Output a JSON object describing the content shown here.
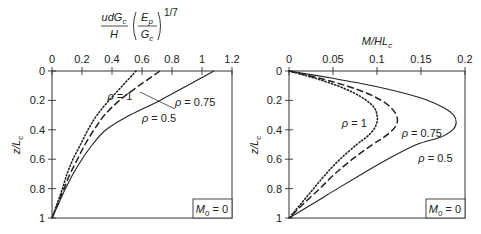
{
  "chart_data": [
    {
      "type": "line",
      "title": "",
      "xlabel": "udG_c/H (E_p/G_c)^(1/7)",
      "xlabel_parts": {
        "numerator": "udG",
        "numerator_sub": "c",
        "denominator": "H",
        "paren_num": "E",
        "paren_num_sub": "p",
        "paren_den": "G",
        "paren_den_sub": "c",
        "exponent": "1/7"
      },
      "ylabel": "z/L_c",
      "ylabel_parts": {
        "main": "z/L",
        "sub": "c"
      },
      "xlim": [
        0,
        1.2
      ],
      "ylim": [
        0,
        1
      ],
      "y_inverted": true,
      "x_axis_position": "top",
      "xticks": [
        "0",
        "0.2",
        "0.4",
        "0.6",
        "0.8",
        "1",
        "1.2"
      ],
      "yticks": [
        "0",
        "0.2",
        "0.4",
        "0.6",
        "0.8",
        "1"
      ],
      "annotation": {
        "text": "M",
        "sub": "0",
        "rest": " = 0"
      },
      "series": [
        {
          "name": "ρ = 0.5",
          "style": "solid",
          "z": [
            0,
            0.1,
            0.2,
            0.3,
            0.4,
            0.5,
            0.6,
            0.7,
            0.8,
            0.9,
            1
          ],
          "values": [
            1.08,
            0.9,
            0.72,
            0.52,
            0.36,
            0.27,
            0.2,
            0.14,
            0.09,
            0.045,
            0
          ]
        },
        {
          "name": "ρ = 0.75",
          "style": "dashed",
          "z": [
            0,
            0.1,
            0.2,
            0.3,
            0.4,
            0.5,
            0.6,
            0.7,
            0.8,
            0.9,
            1
          ],
          "values": [
            0.72,
            0.58,
            0.45,
            0.35,
            0.28,
            0.22,
            0.17,
            0.12,
            0.08,
            0.04,
            0
          ]
        },
        {
          "name": "ρ = 1",
          "style": "dotted",
          "z": [
            0,
            0.1,
            0.2,
            0.3,
            0.4,
            0.5,
            0.6,
            0.7,
            0.8,
            0.9,
            1
          ],
          "values": [
            0.56,
            0.47,
            0.38,
            0.3,
            0.24,
            0.19,
            0.14,
            0.1,
            0.07,
            0.035,
            0
          ]
        }
      ],
      "labels": [
        {
          "text": "ρ = 1",
          "x": 0.37,
          "z": 0.2
        },
        {
          "text": "ρ = 0.75",
          "x": 0.82,
          "z": 0.24
        },
        {
          "text": "ρ = 0.5",
          "x": 0.6,
          "z": 0.35
        }
      ]
    },
    {
      "type": "line",
      "title": "",
      "xlabel": "M/HL_c",
      "xlabel_parts": {
        "main": "M/HL",
        "sub": "c"
      },
      "ylabel": "z/L_c",
      "ylabel_parts": {
        "main": "z/L",
        "sub": "c"
      },
      "xlim": [
        0,
        0.2
      ],
      "ylim": [
        0,
        1
      ],
      "y_inverted": true,
      "x_axis_position": "top",
      "xticks": [
        "0",
        "0.05",
        "0.1",
        "0.15",
        "0.2"
      ],
      "yticks": [
        "0",
        "0.2",
        "0.4",
        "0.6",
        "0.8",
        "1"
      ],
      "annotation": {
        "text": "M",
        "sub": "0",
        "rest": " = 0"
      },
      "series": [
        {
          "name": "ρ = 0.5",
          "style": "solid",
          "z": [
            0,
            0.05,
            0.1,
            0.15,
            0.2,
            0.25,
            0.3,
            0.35,
            0.4,
            0.45,
            0.5,
            0.6,
            0.7,
            0.8,
            0.9,
            1
          ],
          "values": [
            0,
            0.05,
            0.095,
            0.13,
            0.158,
            0.176,
            0.187,
            0.19,
            0.186,
            0.172,
            0.145,
            0.112,
            0.083,
            0.055,
            0.028,
            0
          ]
        },
        {
          "name": "ρ = 0.75",
          "style": "dashed",
          "z": [
            0,
            0.05,
            0.1,
            0.15,
            0.2,
            0.25,
            0.3,
            0.35,
            0.4,
            0.45,
            0.5,
            0.6,
            0.7,
            0.8,
            0.9,
            1
          ],
          "values": [
            0,
            0.035,
            0.065,
            0.088,
            0.105,
            0.116,
            0.122,
            0.123,
            0.118,
            0.108,
            0.095,
            0.072,
            0.052,
            0.035,
            0.017,
            0
          ]
        },
        {
          "name": "ρ = 1",
          "style": "dotted",
          "z": [
            0,
            0.05,
            0.1,
            0.15,
            0.2,
            0.25,
            0.3,
            0.35,
            0.4,
            0.45,
            0.5,
            0.6,
            0.7,
            0.8,
            0.9,
            1
          ],
          "values": [
            0,
            0.03,
            0.055,
            0.074,
            0.088,
            0.097,
            0.1,
            0.1,
            0.096,
            0.088,
            0.077,
            0.058,
            0.042,
            0.028,
            0.014,
            0
          ]
        }
      ],
      "labels": [
        {
          "text": "ρ = 1",
          "x": 0.06,
          "z": 0.38
        },
        {
          "text": "ρ = 0.75",
          "x": 0.128,
          "z": 0.45
        },
        {
          "text": "ρ = 0.5",
          "x": 0.147,
          "z": 0.62
        }
      ]
    }
  ]
}
